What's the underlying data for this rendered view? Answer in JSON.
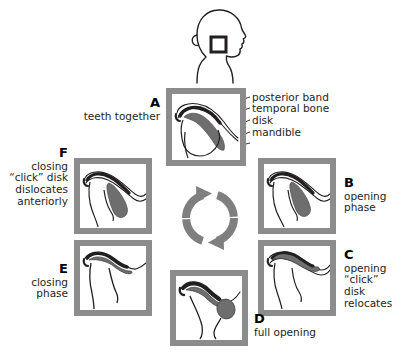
{
  "figure": {
    "frame_color": "#8c8c8c",
    "disk_color": "#6e6e6e",
    "bone_color": "#231f20"
  },
  "head_inset": {
    "name": "head-profile-with-tmj-marker",
    "marker": "square"
  },
  "cycle_arrow": {
    "name": "circular-cycle-arrow",
    "color": "#7f7f7f",
    "direction": "clockwise"
  },
  "callouts": {
    "items": [
      {
        "label": "posterior band"
      },
      {
        "label": "temporal bone"
      },
      {
        "label": "disk"
      },
      {
        "label": "mandible"
      }
    ]
  },
  "panels": [
    {
      "id": "A",
      "letter": "A",
      "caption_lines": [
        "teeth together"
      ],
      "caption_side": "left"
    },
    {
      "id": "B",
      "letter": "B",
      "caption_lines": [
        "opening",
        "phase"
      ],
      "caption_side": "right"
    },
    {
      "id": "C",
      "letter": "C",
      "caption_lines": [
        "opening",
        "“click”",
        "disk",
        "relocates"
      ],
      "caption_side": "right"
    },
    {
      "id": "D",
      "letter": "D",
      "caption_lines": [
        "full opening"
      ],
      "caption_side": "right"
    },
    {
      "id": "E",
      "letter": "E",
      "caption_lines": [
        "closing",
        "phase"
      ],
      "caption_side": "left"
    },
    {
      "id": "F",
      "letter": "F",
      "caption_lines": [
        "closing",
        "“click” disk",
        "dislocates",
        "anteriorly"
      ],
      "caption_side": "left"
    }
  ]
}
